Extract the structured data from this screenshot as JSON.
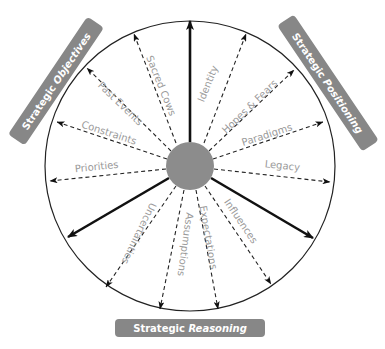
{
  "diagram": {
    "colors": {
      "pill": "#878787",
      "hub": "#8c8c8c",
      "line": "#111111",
      "label": "#9a9a9a",
      "pill_text": "#ffffff"
    },
    "center_hub": {
      "shape": "circle",
      "fill": "#8c8c8c"
    },
    "outer_circle": {
      "shape": "circle"
    },
    "pills": {
      "objectives": {
        "prefix": "Strategic ",
        "emphasis": "Objectives"
      },
      "positioning": {
        "prefix": "Strategic ",
        "emphasis": "Positioning"
      },
      "reasoning": {
        "prefix": "Strategic ",
        "emphasis": "Reasoning"
      }
    },
    "solid_arrows": [
      "up",
      "lower-left",
      "lower-right"
    ],
    "labels": {
      "sacred_cows": "Sacred Cows",
      "identity": "Identity",
      "past_events": "Past Events",
      "hopes_fears": "Hopes & Fears",
      "constraints": "Constraints",
      "paradigms": "Paradigms",
      "priorities": "Priorities",
      "legacy": "Legacy",
      "uncertainties": "Uncertainties",
      "assumptions": "Assumptions",
      "expectations": "Expectations",
      "influences": "Influences"
    }
  }
}
